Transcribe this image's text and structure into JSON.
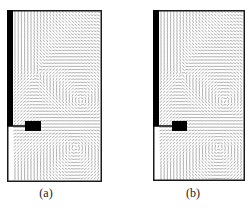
{
  "figure": {
    "panels": [
      {
        "id": "a",
        "label": "(a)"
      },
      {
        "id": "b",
        "label": "(b)"
      }
    ]
  },
  "colors": {
    "frame": "#1a1a1a",
    "obstacle": "#000000",
    "vector": "#777777",
    "background": "#ffffff"
  }
}
